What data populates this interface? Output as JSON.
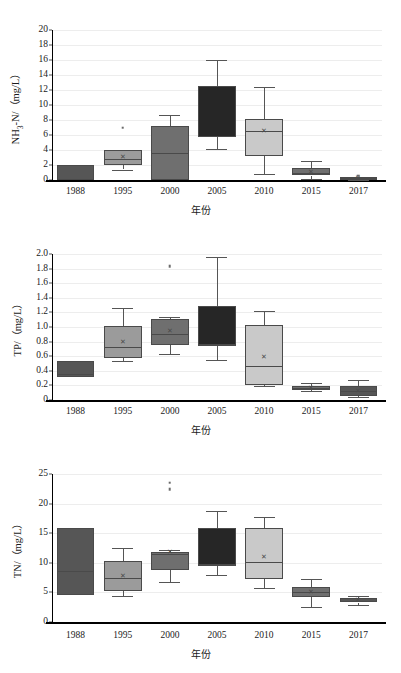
{
  "figure": {
    "xlabel": "年份",
    "categories": [
      "1988",
      "1995",
      "2000",
      "2005",
      "2010",
      "2015",
      "2017"
    ],
    "palette": {
      "1988": "#565656",
      "1995": "#9b9b9b",
      "2000": "#6f6f6f",
      "2005": "#262626",
      "2010": "#c9c9c9",
      "2015": "#6f6f6f",
      "2017": "#565656"
    }
  },
  "chart_data": [
    {
      "type": "box",
      "title": "",
      "ylabel_html": "NH<sub>3</sub>-N/（mg/L）",
      "ylabel": "NH3-N/（mg/L）",
      "xlabel": "年份",
      "ylim": [
        0,
        20
      ],
      "yticks": [
        "0",
        "2",
        "4",
        "6",
        "8",
        "10",
        "12",
        "14",
        "16",
        "18",
        "20"
      ],
      "ytick_values": [
        0,
        2,
        4,
        6,
        8,
        10,
        12,
        14,
        16,
        18,
        20
      ],
      "categories": [
        "1988",
        "1995",
        "2000",
        "2005",
        "2010",
        "2015",
        "2017"
      ],
      "grid": true,
      "boxes": [
        {
          "category": "1988",
          "whisker_low": 0.0,
          "q1": 0.0,
          "median": 0.0,
          "mean": null,
          "q3": 2.05,
          "whisker_high": 2.05,
          "outliers": []
        },
        {
          "category": "1995",
          "whisker_low": 1.4,
          "q1": 1.95,
          "median": 2.85,
          "mean": 3.1,
          "q3": 3.95,
          "whisker_high": 3.95,
          "outliers": [
            6.95
          ]
        },
        {
          "category": "2000",
          "whisker_low": 0.0,
          "q1": 0.0,
          "median": 3.6,
          "mean": null,
          "q3": 7.2,
          "whisker_high": 8.7,
          "outliers": []
        },
        {
          "category": "2005",
          "whisker_low": 4.1,
          "q1": 5.8,
          "median": 5.9,
          "mean": null,
          "q3": 12.6,
          "whisker_high": 16.0,
          "outliers": []
        },
        {
          "category": "2010",
          "whisker_low": 0.75,
          "q1": 3.2,
          "median": 6.55,
          "mean": 6.5,
          "q3": 8.1,
          "whisker_high": 12.35,
          "outliers": []
        },
        {
          "category": "2015",
          "whisker_low": 0.15,
          "q1": 0.6,
          "median": 0.95,
          "mean": 1.05,
          "q3": 1.55,
          "whisker_high": 2.55,
          "outliers": []
        },
        {
          "category": "2017",
          "whisker_low": 0.05,
          "q1": 0.1,
          "median": 0.2,
          "mean": 0.25,
          "q3": 0.4,
          "whisker_high": 0.45,
          "outliers": [
            0.55
          ]
        }
      ]
    },
    {
      "type": "box",
      "title": "",
      "ylabel_html": "TP/（mg/L）",
      "ylabel": "TP/（mg/L）",
      "xlabel": "年份",
      "ylim": [
        0,
        2.0
      ],
      "yticks": [
        "0",
        "0.2",
        "0.4",
        "0.6",
        "0.8",
        "1.0",
        "1.2",
        "1.4",
        "1.6",
        "1.8",
        "2.0"
      ],
      "ytick_values": [
        0,
        0.2,
        0.4,
        0.6,
        0.8,
        1.0,
        1.2,
        1.4,
        1.6,
        1.8,
        2.0
      ],
      "categories": [
        "1988",
        "1995",
        "2000",
        "2005",
        "2010",
        "2015",
        "2017"
      ],
      "grid": true,
      "boxes": [
        {
          "category": "1988",
          "whisker_low": 0.32,
          "q1": 0.32,
          "median": 0.36,
          "mean": null,
          "q3": 0.54,
          "whisker_high": 0.54,
          "outliers": []
        },
        {
          "category": "1995",
          "whisker_low": 0.54,
          "q1": 0.58,
          "median": 0.73,
          "mean": 0.79,
          "q3": 1.01,
          "whisker_high": 1.26,
          "outliers": []
        },
        {
          "category": "2000",
          "whisker_low": 0.63,
          "q1": 0.75,
          "median": 0.9,
          "mean": 0.95,
          "q3": 1.11,
          "whisker_high": 1.14,
          "outliers": [
            1.83
          ]
        },
        {
          "category": "2005",
          "whisker_low": 0.55,
          "q1": 0.75,
          "median": 0.76,
          "mean": null,
          "q3": 1.29,
          "whisker_high": 1.96,
          "outliers": []
        },
        {
          "category": "2010",
          "whisker_low": 0.19,
          "q1": 0.2,
          "median": 0.47,
          "mean": 0.59,
          "q3": 1.03,
          "whisker_high": 1.22,
          "outliers": []
        },
        {
          "category": "2015",
          "whisker_low": 0.13,
          "q1": 0.14,
          "median": 0.17,
          "mean": 0.17,
          "q3": 0.19,
          "whisker_high": 0.23,
          "outliers": []
        },
        {
          "category": "2017",
          "whisker_low": 0.04,
          "q1": 0.06,
          "median": 0.12,
          "mean": 0.13,
          "q3": 0.19,
          "whisker_high": 0.27,
          "outliers": []
        }
      ]
    },
    {
      "type": "box",
      "title": "",
      "ylabel_html": "TN/（mg/L）",
      "ylabel": "TN/（mg/L）",
      "xlabel": "年份",
      "ylim": [
        0,
        25
      ],
      "yticks": [
        "0",
        "5",
        "10",
        "15",
        "20",
        "25"
      ],
      "ytick_values": [
        0,
        5,
        10,
        15,
        20,
        25
      ],
      "categories": [
        "1988",
        "1995",
        "2000",
        "2005",
        "2010",
        "2015",
        "2017"
      ],
      "grid": true,
      "boxes": [
        {
          "category": "1988",
          "whisker_low": 4.6,
          "q1": 4.6,
          "median": 8.7,
          "mean": null,
          "q3": 15.9,
          "whisker_high": 15.9,
          "outliers": []
        },
        {
          "category": "1995",
          "whisker_low": 4.4,
          "q1": 5.3,
          "median": 7.5,
          "mean": 7.7,
          "q3": 10.3,
          "whisker_high": 12.5,
          "outliers": []
        },
        {
          "category": "2000",
          "whisker_low": 6.8,
          "q1": 8.8,
          "median": 11.5,
          "mean": 11.8,
          "q3": 11.8,
          "whisker_high": 12.1,
          "outliers": [
            23.5,
            22.4
          ]
        },
        {
          "category": "2005",
          "whisker_low": 7.9,
          "q1": 9.5,
          "median": 9.8,
          "mean": null,
          "q3": 15.9,
          "whisker_high": 18.8,
          "outliers": []
        },
        {
          "category": "2010",
          "whisker_low": 5.7,
          "q1": 7.2,
          "median": 10.2,
          "mean": 11.0,
          "q3": 15.9,
          "whisker_high": 17.8,
          "outliers": []
        },
        {
          "category": "2015",
          "whisker_low": 2.5,
          "q1": 4.3,
          "median": 5.0,
          "mean": 5.1,
          "q3": 5.9,
          "whisker_high": 7.2,
          "outliers": []
        },
        {
          "category": "2017",
          "whisker_low": 2.9,
          "q1": 3.3,
          "median": 3.6,
          "mean": 3.7,
          "q3": 4.0,
          "whisker_high": 4.4,
          "outliers": []
        }
      ]
    }
  ]
}
